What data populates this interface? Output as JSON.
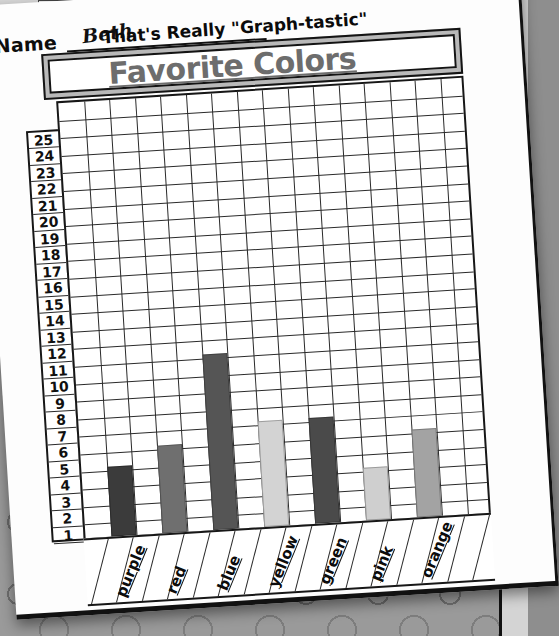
{
  "worksheet": {
    "name_label": "Name",
    "name_value": "Beth",
    "tagline": "That's Really \"Graph-tastic\"",
    "title": "Favorite Colors"
  },
  "chart_data": {
    "type": "bar",
    "title": "Favorite Colors",
    "xlabel": "",
    "ylabel": "",
    "categories": [
      "purple",
      "red",
      "blue",
      "yellow",
      "green",
      "pink",
      "orange"
    ],
    "values": [
      4,
      5,
      10,
      6,
      6,
      3,
      5
    ],
    "ylim": [
      0,
      25
    ],
    "yticks": [
      1,
      2,
      3,
      4,
      5,
      6,
      7,
      8,
      9,
      10,
      11,
      12,
      13,
      14,
      15,
      16,
      17,
      18,
      19,
      20,
      21,
      22,
      23,
      24,
      25
    ],
    "ytick_labels": [
      "1",
      "2",
      "3",
      "4",
      "5",
      "6",
      "7",
      "8",
      "9",
      "10",
      "11",
      "12",
      "13",
      "14",
      "15",
      "16",
      "17",
      "18",
      "19",
      "20",
      "21",
      "22",
      "23",
      "24",
      "25"
    ],
    "grid": true,
    "legend": "none",
    "bar_colors": [
      "#3b3b3b",
      "#6f6f6f",
      "#555555",
      "#d3d3d3",
      "#4a4a4a",
      "#cfcfcf",
      "#a3a3a3"
    ],
    "grid_columns": 16,
    "grid_rows": 25
  }
}
